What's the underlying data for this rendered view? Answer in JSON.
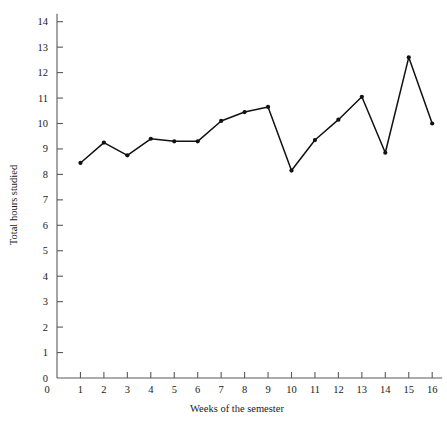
{
  "chart_data": {
    "type": "line",
    "title": "",
    "xlabel": "Weeks of the semester",
    "ylabel": "Total hours studied",
    "x": [
      1,
      2,
      3,
      4,
      5,
      6,
      7,
      8,
      9,
      10,
      11,
      12,
      13,
      14,
      15,
      16
    ],
    "categories": [
      "1",
      "2",
      "3",
      "4",
      "5",
      "6",
      "7",
      "8",
      "9",
      "10",
      "11",
      "12",
      "13",
      "14",
      "15",
      "16"
    ],
    "values": [
      8.45,
      9.25,
      8.75,
      9.4,
      9.3,
      9.3,
      10.1,
      10.45,
      10.65,
      8.15,
      9.35,
      10.15,
      11.05,
      8.85,
      12.6,
      10.0
    ],
    "series": [
      {
        "name": "Total hours studied",
        "values": [
          8.45,
          9.25,
          8.75,
          9.4,
          9.3,
          9.3,
          10.1,
          10.45,
          10.65,
          8.15,
          9.35,
          10.15,
          11.05,
          8.85,
          12.6,
          10.0
        ]
      }
    ],
    "xlim": [
      0,
      16
    ],
    "ylim": [
      0,
      14
    ],
    "xticks": [
      0,
      1,
      2,
      3,
      4,
      5,
      6,
      7,
      8,
      9,
      10,
      11,
      12,
      13,
      14,
      15,
      16
    ],
    "xtick_labels": [
      "0",
      "1",
      "2",
      "3",
      "4",
      "5",
      "6",
      "7",
      "8",
      "9",
      "10",
      "11",
      "12",
      "13",
      "14",
      "15",
      "16"
    ],
    "yticks": [
      0,
      1,
      2,
      3,
      4,
      5,
      6,
      7,
      8,
      9,
      10,
      11,
      12,
      13,
      14
    ],
    "ytick_labels": [
      "0",
      "1",
      "2",
      "3",
      "4",
      "5",
      "6",
      "7",
      "8",
      "9",
      "10",
      "11",
      "12",
      "13",
      "14"
    ],
    "grid": false,
    "legend": false,
    "legend_position": "none",
    "markers": "filled-circle",
    "line_color": "#111111",
    "marker_color": "#111111",
    "axis_color": "#5a5a5a",
    "background_color": "#ffffff"
  }
}
